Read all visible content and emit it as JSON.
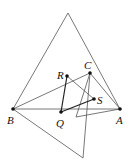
{
  "diagram": {
    "points": {
      "B": {
        "label": "B",
        "x": 13,
        "y": 109
      },
      "A": {
        "label": "A",
        "x": 120,
        "y": 109
      },
      "C": {
        "label": "C",
        "x": 90,
        "y": 73
      },
      "R": {
        "label": "R",
        "x": 67,
        "y": 76
      },
      "S": {
        "label": "S",
        "x": 94,
        "y": 99
      },
      "Q": {
        "label": "Q",
        "x": 61,
        "y": 112
      }
    },
    "unlabeled_vertices": {
      "top": {
        "x": 68,
        "y": 13
      },
      "bottom": {
        "x": 83,
        "y": 158
      },
      "inner": {
        "x": 76,
        "y": 117
      }
    }
  }
}
